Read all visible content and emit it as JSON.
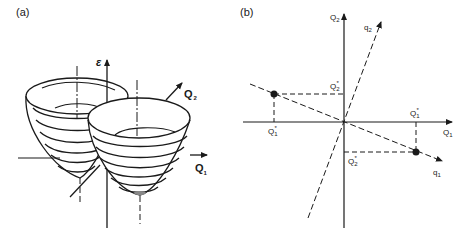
{
  "panels": {
    "a": {
      "label": "(a)",
      "axes": {
        "vertical": "ε",
        "horizontal": "Q",
        "horizontal_sub": "1",
        "depth": "Q",
        "depth_sub": "2"
      },
      "description": "Two intersecting paraboloid energy surfaces over Q1–Q2 plane"
    },
    "b": {
      "label": "(b)",
      "axes": {
        "Q1": "Q",
        "Q1_sub": "1",
        "Q2": "Q",
        "Q2_sub": "2",
        "q1": "q",
        "q1_sub": "1",
        "q2": "q",
        "q2_sub": "2"
      },
      "points": [
        {
          "name": "left-minimum",
          "q1_label": "Q",
          "q1_sub": "1",
          "q1_sup": "*",
          "q2_label": "Q",
          "q2_sub": "2",
          "q2_sup": "*"
        },
        {
          "name": "right-minimum",
          "q1_label": "Q",
          "q1_sub": "1",
          "q1_sup": "*",
          "q2_label": "Q",
          "q2_sub": "2",
          "q2_sup": "*"
        }
      ]
    }
  },
  "colors": {
    "ink": "#1a1a1a",
    "background": "#ffffff"
  }
}
